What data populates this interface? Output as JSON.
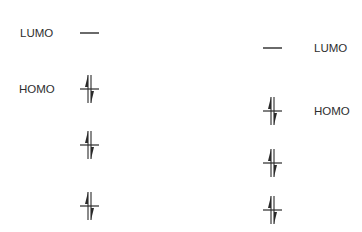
{
  "diagram": {
    "type": "molecular-orbital-energy-levels",
    "colors": {
      "line": "#2a2a2a",
      "text": "#2e2e2e",
      "background": "#ffffff"
    },
    "left_column": {
      "labels": [
        {
          "text": "LUMO",
          "x": 20,
          "y": 33
        },
        {
          "text": "HOMO",
          "x": 19,
          "y": 89
        }
      ],
      "levels": [
        {
          "name": "LUMO",
          "x": 80,
          "y": 33,
          "occupancy": "empty"
        },
        {
          "name": "HOMO",
          "x": 80,
          "y": 89,
          "occupancy": "paired"
        },
        {
          "name": "HOMO-1",
          "x": 80,
          "y": 145,
          "occupancy": "paired"
        },
        {
          "name": "HOMO-2",
          "x": 80,
          "y": 206,
          "occupancy": "paired"
        }
      ]
    },
    "right_column": {
      "labels": [
        {
          "text": "LUMO",
          "x": 314,
          "y": 48
        },
        {
          "text": "HOMO",
          "x": 314,
          "y": 111
        }
      ],
      "levels": [
        {
          "name": "LUMO",
          "x": 263,
          "y": 48,
          "occupancy": "empty"
        },
        {
          "name": "HOMO",
          "x": 263,
          "y": 111,
          "occupancy": "paired"
        },
        {
          "name": "HOMO-1",
          "x": 263,
          "y": 163,
          "occupancy": "paired"
        },
        {
          "name": "HOMO-2",
          "x": 263,
          "y": 210,
          "occupancy": "paired"
        }
      ]
    }
  }
}
